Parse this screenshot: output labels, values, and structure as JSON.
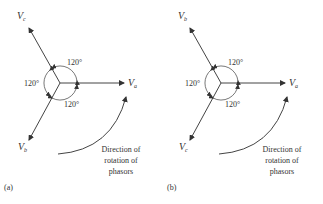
{
  "figure": {
    "panels": [
      {
        "id": "a",
        "caption": "(a)",
        "phasors": [
          {
            "name": "V",
            "sub": "a",
            "angle_deg": 0
          },
          {
            "name": "V",
            "sub": "c",
            "angle_deg": 120
          },
          {
            "name": "V",
            "sub": "b",
            "angle_deg": 240
          }
        ],
        "angles": [
          "120°",
          "120°",
          "120°"
        ],
        "rotation_label": [
          "Direction of",
          "rotation of",
          "phasors"
        ]
      },
      {
        "id": "b",
        "caption": "(b)",
        "phasors": [
          {
            "name": "V",
            "sub": "a",
            "angle_deg": 0
          },
          {
            "name": "V",
            "sub": "b",
            "angle_deg": 120
          },
          {
            "name": "V",
            "sub": "c",
            "angle_deg": 240
          }
        ],
        "angles": [
          "120°",
          "120°",
          "120°"
        ],
        "rotation_label": [
          "Direction of",
          "rotation of",
          "phasors"
        ]
      }
    ],
    "colors": {
      "line": "#444444",
      "text": "#333333"
    }
  }
}
